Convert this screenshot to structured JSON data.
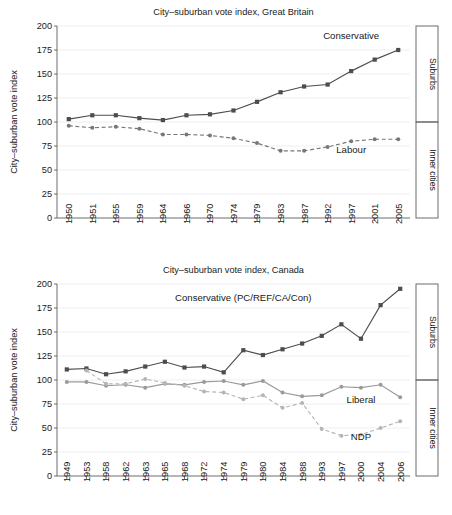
{
  "figure": {
    "side_labels": {
      "upper": "Suburbs",
      "lower": "Inner cities"
    },
    "y_axis_title": "City–suburban vote index"
  },
  "chart_data": [
    {
      "type": "line",
      "id": "great-britain",
      "title": "City–suburban vote index, Great Britain",
      "xlabel": "",
      "ylabel": "City–suburban vote index",
      "ylim": [
        0,
        200
      ],
      "yticks": [
        0,
        25,
        50,
        75,
        100,
        125,
        150,
        175,
        200
      ],
      "grid": true,
      "legend": "inline-annotations",
      "reference_line": 100,
      "categories": [
        "1950",
        "1951",
        "1955",
        "1959",
        "1964",
        "1966",
        "1970",
        "1974",
        "1979",
        "1983",
        "1987",
        "1992",
        "1997",
        "2001",
        "2005"
      ],
      "series": [
        {
          "name": "Conservative",
          "marker": "square",
          "dash": "solid",
          "color": "#4d4d4d",
          "label_x_index": 12,
          "label_y": 186,
          "values": [
            103,
            107,
            107,
            104,
            102,
            107,
            108,
            112,
            121,
            131,
            137,
            139,
            153,
            165,
            175
          ]
        },
        {
          "name": "Labour",
          "marker": "circle",
          "dash": "dashed",
          "color": "#777777",
          "label_x_index": 12,
          "label_y": 68,
          "values": [
            96,
            94,
            95,
            93,
            87,
            87,
            86,
            83,
            78,
            70,
            70,
            74,
            80,
            82,
            82
          ]
        }
      ]
    },
    {
      "type": "line",
      "id": "canada",
      "title": "City–suburban vote index, Canada",
      "xlabel": "",
      "ylabel": "City–suburban vote index",
      "ylim": [
        0,
        200
      ],
      "yticks": [
        0,
        25,
        50,
        75,
        100,
        125,
        150,
        175,
        200
      ],
      "grid": true,
      "legend": "inline-annotations",
      "reference_line": 100,
      "categories": [
        "1949",
        "1953",
        "1958",
        "1962",
        "1963",
        "1965",
        "1968",
        "1972",
        "1974",
        "1979",
        "1980",
        "1984",
        "1988",
        "1993",
        "1997",
        "2000",
        "2004",
        "2006"
      ],
      "series": [
        {
          "name": "Conservative (PC/REF/CA/Con)",
          "marker": "square",
          "dash": "solid",
          "color": "#4d4d4d",
          "label_x_index": 9,
          "label_y": 182,
          "values": [
            111,
            112,
            106,
            109,
            114,
            119,
            113,
            114,
            108,
            131,
            126,
            132,
            138,
            146,
            158,
            143,
            178,
            195
          ]
        },
        {
          "name": "Liberal",
          "marker": "circle",
          "dash": "solid",
          "color": "#9a9a9a",
          "label_x_index": 15,
          "label_y": 76,
          "values": [
            98,
            98,
            94,
            95,
            92,
            96,
            95,
            98,
            99,
            95,
            99,
            87,
            83,
            84,
            93,
            92,
            95,
            82
          ]
        },
        {
          "name": "NDP",
          "marker": "circle",
          "dash": "dashed",
          "color": "#b5b5b5",
          "label_x_index": 15,
          "label_y": 38,
          "values": [
            null,
            110,
            96,
            96,
            101,
            97,
            94,
            88,
            87,
            80,
            84,
            71,
            76,
            49,
            42,
            43,
            50,
            57
          ]
        }
      ]
    }
  ]
}
